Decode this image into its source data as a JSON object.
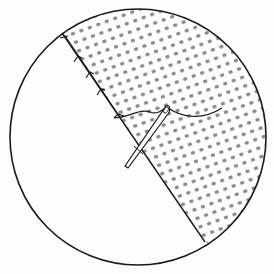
{
  "diagram": {
    "colors": {
      "background": "#fdfdfd",
      "stroke": "#1a1a1a",
      "dot": "#8a8a8a"
    },
    "circle": {
      "cx": 138,
      "cy": 137,
      "r": 128
    },
    "fold_line": {
      "x1": 62,
      "y1": 33,
      "x2": 205,
      "y2": 242
    },
    "regions": [
      {
        "name": "plain-fabric",
        "fill": "white"
      },
      {
        "name": "patterned-fabric",
        "fill": "dotted"
      }
    ],
    "elements": [
      "needle",
      "thread",
      "stitches"
    ]
  }
}
